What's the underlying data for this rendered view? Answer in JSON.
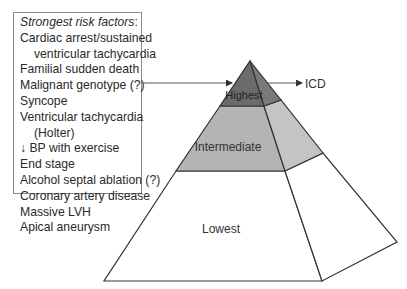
{
  "risk_box": {
    "heading": "Strongest risk factors",
    "heading_suffix": ":",
    "items": [
      {
        "text": "Cardiac arrest/sustained",
        "indent": false
      },
      {
        "text": "ventricular tachycardia",
        "indent": true
      },
      {
        "text": "Familial sudden death",
        "indent": false
      },
      {
        "text": "Malignant genotype (?)",
        "indent": false
      },
      {
        "text": "Syncope",
        "indent": false
      },
      {
        "text": "Ventricular tachycardia",
        "indent": false
      },
      {
        "text": "(Holter)",
        "indent": true
      },
      {
        "text": "↓ BP with exercise",
        "indent": false
      },
      {
        "text": "End stage",
        "indent": false
      },
      {
        "text": "Alcohol septal ablation (?)",
        "indent": false
      },
      {
        "text": "Coronary artery disease",
        "indent": false
      },
      {
        "text": "Massive LVH",
        "indent": false
      },
      {
        "text": "Apical aneurysm",
        "indent": false
      }
    ]
  },
  "pyramid": {
    "tiers": [
      {
        "label": "Highest",
        "color": "#6b6b6b"
      },
      {
        "label": "Intermediate",
        "color": "#b4b4b4"
      },
      {
        "label": "Lowest",
        "color": "#ffffff"
      }
    ],
    "outcome_label": "ICD"
  }
}
